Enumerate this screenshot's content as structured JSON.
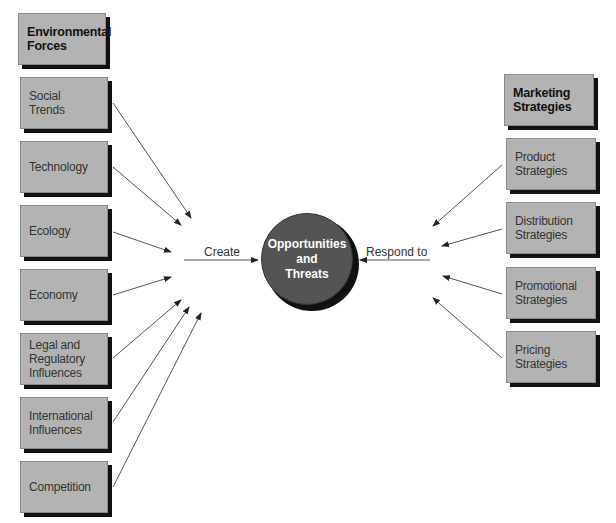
{
  "diagram": {
    "left_column": {
      "header": "Environmental\nForces",
      "items": [
        "Social Trends",
        "Technology",
        "Ecology",
        "Economy",
        "Legal and\nRegulatory\nInfluences",
        "International\nInfluences",
        "Competition"
      ]
    },
    "center": {
      "label": "Opportunities\nand\nThreats",
      "color": "#545454"
    },
    "edge_labels": {
      "left": "Create",
      "right": "Respond to"
    },
    "right_column": {
      "header": "Marketing\nStrategies",
      "items": [
        "Product\nStrategies",
        "Distribution\nStrategies",
        "Promotional\nStrategies",
        "Pricing\nStrategies"
      ]
    },
    "box_fill": "#b3b3b3",
    "box_shadow": "#111111"
  }
}
